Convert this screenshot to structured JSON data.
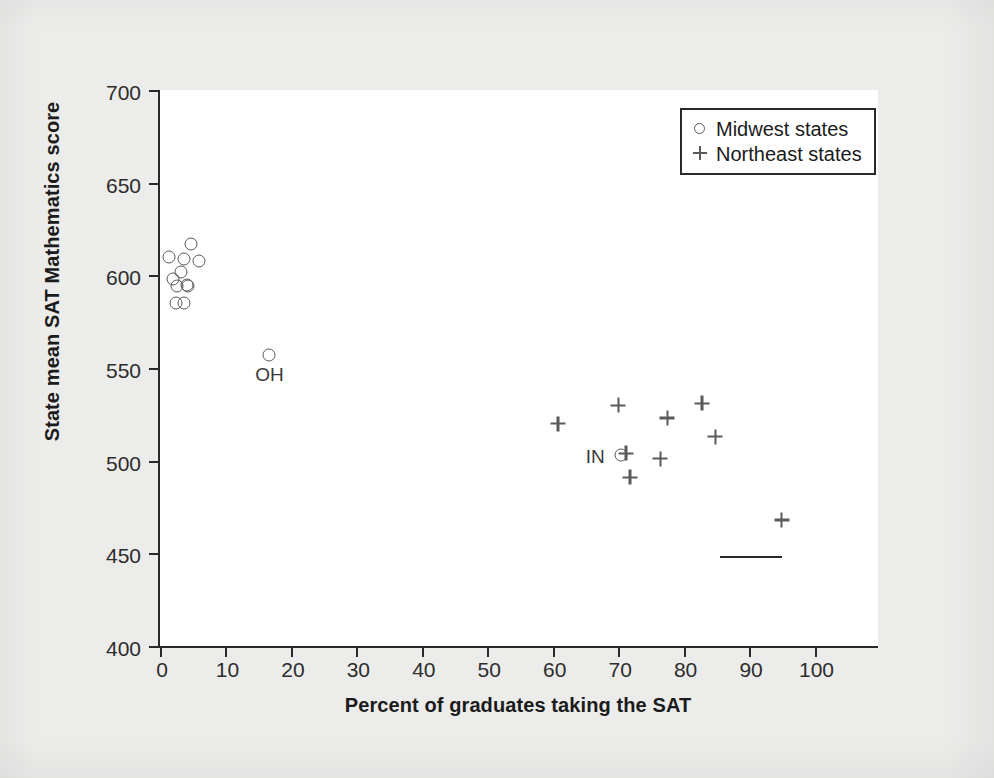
{
  "chart_data": {
    "type": "scatter",
    "title": "",
    "xlabel": "Percent of graduates taking the SAT",
    "ylabel": "State mean SAT Mathematics score",
    "xlim": [
      0,
      110
    ],
    "ylim": [
      400,
      700
    ],
    "xticks": [
      0,
      10,
      20,
      30,
      40,
      50,
      60,
      70,
      80,
      90,
      100
    ],
    "yticks": [
      400,
      450,
      500,
      550,
      600,
      650,
      700
    ],
    "grid": false,
    "legend_position": "top-right",
    "series": [
      {
        "name": "Midwest states",
        "marker": "circle",
        "points": [
          {
            "x": 4.8,
            "y": 617,
            "label": ""
          },
          {
            "x": 1.4,
            "y": 610,
            "label": ""
          },
          {
            "x": 3.7,
            "y": 609,
            "label": ""
          },
          {
            "x": 6.0,
            "y": 608,
            "label": ""
          },
          {
            "x": 3.2,
            "y": 602,
            "label": ""
          },
          {
            "x": 2.0,
            "y": 598,
            "label": ""
          },
          {
            "x": 4.1,
            "y": 595,
            "label": ""
          },
          {
            "x": 2.6,
            "y": 594,
            "label": ""
          },
          {
            "x": 4.3,
            "y": 594,
            "label": ""
          },
          {
            "x": 2.5,
            "y": 585,
            "label": ""
          },
          {
            "x": 3.7,
            "y": 585,
            "label": ""
          },
          {
            "x": 16.7,
            "y": 557,
            "label": "OH"
          },
          {
            "x": 70.4,
            "y": 503,
            "label": "IN"
          }
        ]
      },
      {
        "name": "Northeast states",
        "marker": "plus",
        "points": [
          {
            "x": 60.8,
            "y": 520,
            "label": ""
          },
          {
            "x": 70.0,
            "y": 530,
            "label": ""
          },
          {
            "x": 77.5,
            "y": 523,
            "label": ""
          },
          {
            "x": 82.8,
            "y": 531,
            "label": ""
          },
          {
            "x": 84.8,
            "y": 513,
            "label": ""
          },
          {
            "x": 71.2,
            "y": 504,
            "label": ""
          },
          {
            "x": 76.4,
            "y": 501,
            "label": ""
          },
          {
            "x": 71.8,
            "y": 491,
            "label": ""
          },
          {
            "x": 95.0,
            "y": 468,
            "label": ""
          }
        ]
      }
    ],
    "legend": [
      {
        "marker": "circle",
        "label": "Midwest states"
      },
      {
        "marker": "plus",
        "label": "Northeast states"
      }
    ]
  }
}
